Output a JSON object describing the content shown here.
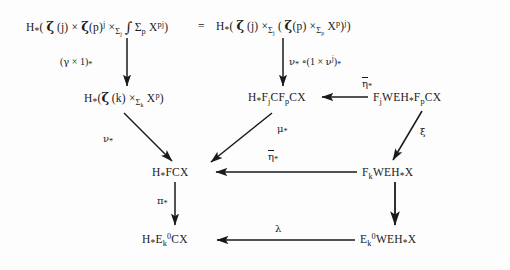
{
  "diagram": {
    "background_color": "#fdfdfd",
    "ink_color": "#1a1a1a",
    "equals_sign": "=",
    "nodes": {
      "top_left": {
        "id": "top-left-node",
        "plain": "H_*( zeta(j) x zeta(p)^j x_{Sigma_j} Int_{Sigma_p} X^{pj} )"
      },
      "top_right": {
        "id": "top-right-node",
        "plain": "H_*( zeta(j) x_{Sigma_j} ( zeta(p) x_{Sigma_p} X^p )^j )"
      },
      "mid_left": {
        "id": "mid-left-node",
        "plain": "H_*( zeta(k) x_{Sigma_k} X^p )"
      },
      "mid_center": {
        "id": "mid-center-node",
        "plain": "H_* F_j C F_p C X"
      },
      "mid_right": {
        "id": "mid-right-node",
        "plain": "F_j W E H_* F_p C X"
      },
      "row3_left": {
        "id": "row3-left-node",
        "plain": "H_* F C X"
      },
      "row3_right": {
        "id": "row3-right-node",
        "plain": "F_k W E H_* X"
      },
      "bottom_left": {
        "id": "bottom-left-node",
        "plain": "H_* E_k^0 C X"
      },
      "bottom_right": {
        "id": "bottom-right-node",
        "plain": "E_k^0 W E H_* X"
      }
    },
    "arrow_labels": {
      "gamma_times_one": "(gamma x 1)_*",
      "nu_comp": "nu_* o (1 x nu^j)_*",
      "nu_star": "nu_*",
      "mu_star": "mu_*",
      "eta_bar_star_upper": "eta-bar_*",
      "eta_bar_star_lower": "eta-bar_*",
      "xi": "xi",
      "pi_star": "pi_*",
      "lambda": "lambda"
    },
    "arrows": [
      {
        "name": "arrow-top-left-down",
        "from": "top_left",
        "to": "mid_left",
        "kind": "vertical",
        "label": "gamma_times_one"
      },
      {
        "name": "arrow-top-right-down",
        "from": "top_right",
        "to": "mid_center",
        "kind": "vertical",
        "label": "nu_comp"
      },
      {
        "name": "arrow-mid-left-diag",
        "from": "mid_left",
        "to": "row3_left",
        "kind": "diagonal",
        "label": "nu_star"
      },
      {
        "name": "arrow-mid-center-diag",
        "from": "mid_center",
        "to": "row3_left",
        "kind": "diagonal",
        "label": "mu_star"
      },
      {
        "name": "arrow-eta-upper",
        "from": "mid_right",
        "to": "mid_center",
        "kind": "horizontal",
        "label": "eta_bar_star_upper"
      },
      {
        "name": "arrow-xi-diag",
        "from": "mid_right",
        "to": "row3_right",
        "kind": "diagonal",
        "label": "xi"
      },
      {
        "name": "arrow-eta-lower",
        "from": "row3_right",
        "to": "row3_left",
        "kind": "horizontal",
        "label": "eta_bar_star_lower"
      },
      {
        "name": "arrow-pi-down",
        "from": "row3_left",
        "to": "bottom_left",
        "kind": "vertical",
        "label": "pi_star"
      },
      {
        "name": "arrow-row3-right-down",
        "from": "row3_right",
        "to": "bottom_right",
        "kind": "vertical",
        "label": null
      },
      {
        "name": "arrow-lambda",
        "from": "bottom_right",
        "to": "bottom_left",
        "kind": "horizontal",
        "label": "lambda"
      }
    ]
  }
}
